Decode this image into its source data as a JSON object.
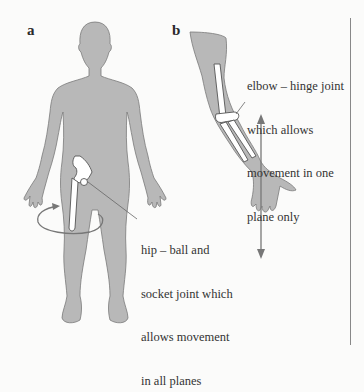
{
  "figure": {
    "panels": [
      {
        "label": "a",
        "subject": "full human body silhouette with hip joint",
        "caption_lines": [
          "hip – ball and",
          "socket joint which",
          "allows movement",
          "in all planes"
        ]
      },
      {
        "label": "b",
        "subject": "arm with elbow joint",
        "caption_lines": [
          "elbow – hinge joint",
          "which allows",
          "movement in one",
          "plane only"
        ]
      }
    ],
    "colors": {
      "silhouette": "#b8b8b8",
      "outline": "#7a7a7a",
      "bone": "#ffffff",
      "arrow": "#777777",
      "background": "#fbfbfa",
      "rule": "#888888"
    },
    "icons": [
      "circular-rotation-arrow-icon",
      "double-headed-vertical-arrow-icon"
    ]
  }
}
